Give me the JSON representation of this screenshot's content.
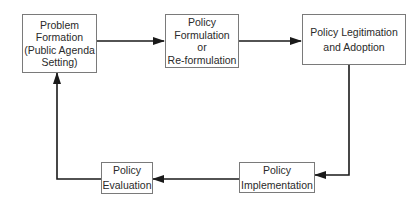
{
  "diagram": {
    "type": "cycle-flowchart",
    "nodes": [
      {
        "id": "problem-formation",
        "lines": [
          "Problem",
          "Formation",
          "(Public Agenda",
          "Setting)"
        ]
      },
      {
        "id": "policy-formulation",
        "lines": [
          "Policy",
          "Formulation",
          "or",
          "Re-formulation"
        ]
      },
      {
        "id": "policy-legitimation",
        "lines": [
          "Policy Legitimation",
          "and Adoption"
        ]
      },
      {
        "id": "policy-implementation",
        "lines": [
          "Policy",
          "Implementation"
        ]
      },
      {
        "id": "policy-evaluation",
        "lines": [
          "Policy",
          "Evaluation"
        ]
      }
    ],
    "edges": [
      {
        "from": "problem-formation",
        "to": "policy-formulation"
      },
      {
        "from": "policy-formulation",
        "to": "policy-legitimation"
      },
      {
        "from": "policy-legitimation",
        "to": "policy-implementation"
      },
      {
        "from": "policy-implementation",
        "to": "policy-evaluation"
      },
      {
        "from": "policy-evaluation",
        "to": "problem-formation"
      }
    ],
    "colors": {
      "line": "#1a1a1a",
      "box_border": "#7a7a7a",
      "text": "#2a2a2a",
      "background": "#ffffff"
    }
  }
}
